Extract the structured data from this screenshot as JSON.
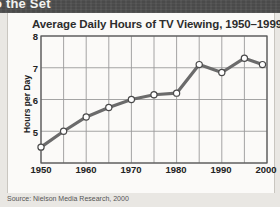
{
  "banner": {
    "text": "o the Set"
  },
  "card": {
    "title": "Average Daily Hours of TV Viewing, 1950–1999",
    "source": "Source: Nielson Media Research, 2000"
  },
  "colors": {
    "line": "#6b6b6b",
    "marker_fill": "#ffffff",
    "marker_stroke": "#4a4a4a",
    "grid": "#9a9a9a",
    "axis": "#555555",
    "card_bg": "#fbfaf8",
    "page_bg": "#e9e7e3",
    "banner_bg": "#4a4a4a",
    "title_text": "#2d2d2d",
    "source_text": "#555555"
  },
  "chart_data": {
    "type": "line",
    "title": "Average Daily Hours of TV Viewing, 1950–1999",
    "xlabel": "",
    "ylabel": "Hours per Day",
    "xlim": [
      1950,
      2000
    ],
    "ylim": [
      4,
      8
    ],
    "grid": true,
    "legend": "none",
    "xtick_labels": [
      "1950",
      "1960",
      "1970",
      "1980",
      "1990",
      "2000"
    ],
    "xtick_values": [
      1950,
      1960,
      1970,
      1980,
      1990,
      2000
    ],
    "ytick_labels": [
      "5",
      "6",
      "7",
      "8"
    ],
    "ytick_values": [
      5,
      6,
      7,
      8
    ],
    "x_minor_step": 5,
    "series": [
      {
        "name": "Average daily hours of TV viewing",
        "x": [
          1950,
          1955,
          1960,
          1965,
          1970,
          1975,
          1980,
          1985,
          1990,
          1995,
          1999
        ],
        "values": [
          4.5,
          5.0,
          5.45,
          5.75,
          6.0,
          6.15,
          6.2,
          7.1,
          6.85,
          7.3,
          7.1
        ]
      }
    ],
    "source": "Source: Nielson Media Research, 2000"
  }
}
